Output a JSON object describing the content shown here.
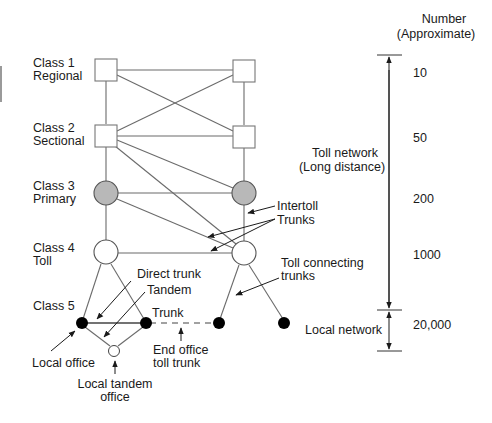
{
  "header": {
    "number_title_line1": "Number",
    "number_title_line2": "(Approximate)"
  },
  "classes": [
    {
      "line1": "Class 1",
      "line2": "Regional",
      "count": "10",
      "shape": "square",
      "fill": "#ffffff"
    },
    {
      "line1": "Class 2",
      "line2": "Sectional",
      "count": "50",
      "shape": "square",
      "fill": "#ffffff"
    },
    {
      "line1": "Class 3",
      "line2": "Primary",
      "count": "200",
      "shape": "circle",
      "fill": "#b8b8b8"
    },
    {
      "line1": "Class 4",
      "line2": "Toll",
      "count": "1000",
      "shape": "circle",
      "fill": "#ffffff"
    },
    {
      "line1": "Class 5",
      "line2": "",
      "count": "20,000",
      "shape": "dot",
      "fill": "#000000"
    }
  ],
  "ranges": {
    "toll_line1": "Toll network",
    "toll_line2": "(Long distance)",
    "local": "Local network"
  },
  "annotations": {
    "intertoll_line1": "Intertoll",
    "intertoll_line2": "Trunks",
    "toll_connecting_line1": "Toll connecting",
    "toll_connecting_line2": "trunks",
    "direct_trunk": "Direct trunk",
    "tandem": "Tandem",
    "trunk": "Trunk",
    "end_office_line1": "End office",
    "end_office_line2": "toll trunk",
    "local_office": "Local office",
    "local_tandem_line1": "Local tandem",
    "local_tandem_line2": "office"
  },
  "colors": {
    "primary_fill": "#b8b8b8",
    "line": "#6b6b6b",
    "text": "#1a1a1a"
  }
}
